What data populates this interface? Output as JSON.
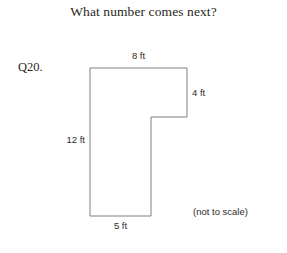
{
  "page": {
    "title": "What number comes next?",
    "question_number": "Q20.",
    "scale_note": "(not to scale)",
    "background_color": "#ffffff",
    "text_color": "#2b2723",
    "figure_stroke_color": "#808080"
  },
  "figure": {
    "shape": "L-shaped polygon",
    "units": "ft",
    "vertices": [
      {
        "x": 90,
        "y": 68
      },
      {
        "x": 187,
        "y": 68
      },
      {
        "x": 187,
        "y": 117
      },
      {
        "x": 151,
        "y": 117
      },
      {
        "x": 151,
        "y": 216
      },
      {
        "x": 90,
        "y": 216
      }
    ],
    "path": "M 90 68 L 187 68 L 187 117 L 151 117 L 151 216 L 90 216 Z",
    "labels": {
      "top": "8 ft",
      "right": "4 ft",
      "left": "12 ft",
      "bottom": "5 ft"
    },
    "dimensions": [
      {
        "side": "top",
        "value": 8,
        "unit": "ft",
        "label": "8 ft"
      },
      {
        "side": "right",
        "value": 4,
        "unit": "ft",
        "label": "4 ft"
      },
      {
        "side": "left",
        "value": 12,
        "unit": "ft",
        "label": "12 ft"
      },
      {
        "side": "bottom",
        "value": 5,
        "unit": "ft",
        "label": "5 ft"
      }
    ]
  }
}
